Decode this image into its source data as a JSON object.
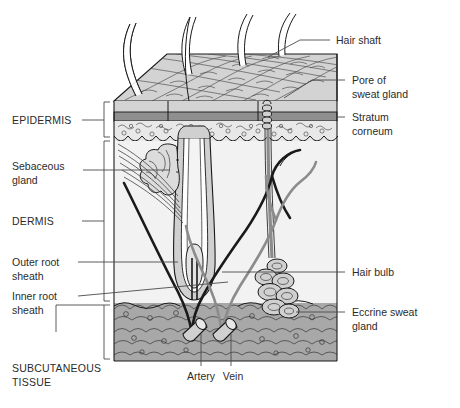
{
  "figure": {
    "domain": "anatomical-diagram"
  },
  "labels": {
    "left": [
      {
        "id": "epidermis",
        "text": "EPIDERMIS",
        "style": "caps"
      },
      {
        "id": "sebaceous",
        "text": "Sebaceous",
        "style": "normal"
      },
      {
        "id": "sebaceous2",
        "text": "gland",
        "style": "normal"
      },
      {
        "id": "dermis",
        "text": "DERMIS",
        "style": "caps"
      },
      {
        "id": "outer-root",
        "text": "Outer root",
        "style": "normal"
      },
      {
        "id": "outer-root2",
        "text": "sheath",
        "style": "normal"
      },
      {
        "id": "inner-root",
        "text": "Inner root",
        "style": "normal"
      },
      {
        "id": "inner-root2",
        "text": "sheath",
        "style": "normal"
      },
      {
        "id": "subcutaneous",
        "text": "SUBCUTANEOUS",
        "style": "caps"
      },
      {
        "id": "subcutaneous2",
        "text": "TISSUE",
        "style": "caps"
      }
    ],
    "right": [
      {
        "id": "hair-shaft",
        "text": "Hair shaft",
        "style": "normal"
      },
      {
        "id": "pore",
        "text": "Pore of",
        "style": "normal"
      },
      {
        "id": "pore2",
        "text": "sweat gland",
        "style": "normal"
      },
      {
        "id": "stratum",
        "text": "Stratum",
        "style": "normal"
      },
      {
        "id": "stratum2",
        "text": "corneum",
        "style": "normal"
      },
      {
        "id": "hair-bulb",
        "text": "Hair bulb",
        "style": "normal"
      },
      {
        "id": "eccrine",
        "text": "Eccrine sweat",
        "style": "normal"
      },
      {
        "id": "eccrine2",
        "text": "gland",
        "style": "normal"
      }
    ],
    "bottom": [
      {
        "id": "artery",
        "text": "Artery",
        "style": "normal"
      },
      {
        "id": "vein",
        "text": "Vein",
        "style": "normal"
      }
    ]
  },
  "colors": {
    "surface_top": "#d3d3d3",
    "surface_side": "#c8c8c8",
    "stratum_corneum": "#8f8f8f",
    "epidermis_lower": "#e8e8e8",
    "dermis": "#f2f2f2",
    "subcutaneous": "#a8a8a8",
    "structure_fill": "#d0d0d0",
    "hair_fill": "#ffffff",
    "artery": "#1a1a1a",
    "vein": "#8c8c8c",
    "outline": "#1a1a1a",
    "leader_line": "#4a4a4a",
    "text": "#2b2b2b"
  },
  "structures": {
    "hair_shaft_count": 4,
    "layers": [
      "Epidermis",
      "Dermis",
      "Subcutaneous tissue"
    ],
    "vessels": [
      "Artery",
      "Vein"
    ],
    "glands": [
      "Sebaceous gland",
      "Eccrine sweat gland"
    ]
  }
}
